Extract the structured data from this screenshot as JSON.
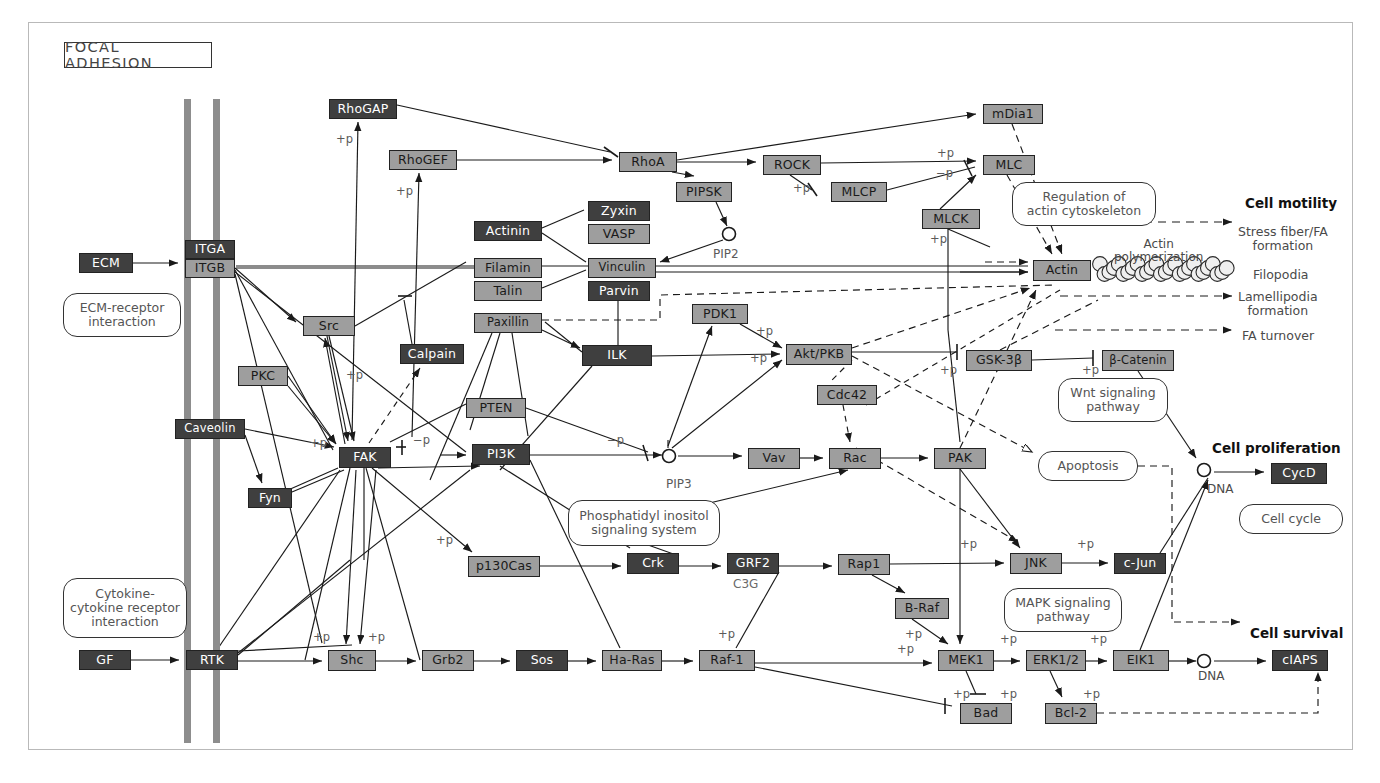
{
  "title": "FOCAL ADHESION",
  "nodes": [
    {
      "id": "rhogap",
      "label": "RhoGAP",
      "x": 329,
      "y": 99,
      "w": 68,
      "h": 20,
      "style": "dark"
    },
    {
      "id": "rhogef",
      "label": "RhoGEF",
      "x": 389,
      "y": 150,
      "w": 68,
      "h": 20,
      "style": "light"
    },
    {
      "id": "mdia1",
      "label": "mDia1",
      "x": 983,
      "y": 104,
      "w": 60,
      "h": 20,
      "style": "light"
    },
    {
      "id": "rhoa",
      "label": "RhoA",
      "x": 619,
      "y": 152,
      "w": 58,
      "h": 20,
      "style": "light"
    },
    {
      "id": "rock",
      "label": "ROCK",
      "x": 763,
      "y": 155,
      "w": 58,
      "h": 20,
      "style": "light"
    },
    {
      "id": "mlc",
      "label": "MLC",
      "x": 983,
      "y": 155,
      "w": 52,
      "h": 20,
      "style": "light"
    },
    {
      "id": "pipsk",
      "label": "PIPSK",
      "x": 676,
      "y": 182,
      "w": 56,
      "h": 20,
      "style": "light"
    },
    {
      "id": "mlcp",
      "label": "MLCP",
      "x": 831,
      "y": 182,
      "w": 56,
      "h": 20,
      "style": "light"
    },
    {
      "id": "mlck",
      "label": "MLCK",
      "x": 922,
      "y": 209,
      "w": 58,
      "h": 20,
      "style": "light"
    },
    {
      "id": "zyxin",
      "label": "Zyxin",
      "x": 588,
      "y": 201,
      "w": 62,
      "h": 20,
      "style": "dark"
    },
    {
      "id": "actinin",
      "label": "Actinin",
      "x": 474,
      "y": 221,
      "w": 68,
      "h": 20,
      "style": "dark"
    },
    {
      "id": "vasp",
      "label": "VASP",
      "x": 588,
      "y": 224,
      "w": 62,
      "h": 20,
      "style": "light"
    },
    {
      "id": "ecm",
      "label": "ECM",
      "x": 79,
      "y": 253,
      "w": 54,
      "h": 20,
      "style": "dark"
    },
    {
      "id": "itga",
      "label": "ITGA",
      "x": 185,
      "y": 240,
      "w": 50,
      "h": 19,
      "style": "dark"
    },
    {
      "id": "itgb",
      "label": "ITGB",
      "x": 185,
      "y": 259,
      "w": 50,
      "h": 19,
      "style": "light"
    },
    {
      "id": "filamin",
      "label": "Filamin",
      "x": 474,
      "y": 258,
      "w": 68,
      "h": 20,
      "style": "light"
    },
    {
      "id": "vinculin",
      "label": "Vinculin",
      "x": 588,
      "y": 258,
      "w": 68,
      "h": 20,
      "style": "light"
    },
    {
      "id": "talin",
      "label": "Talin",
      "x": 474,
      "y": 281,
      "w": 68,
      "h": 20,
      "style": "light"
    },
    {
      "id": "parvin",
      "label": "Parvin",
      "x": 588,
      "y": 281,
      "w": 62,
      "h": 20,
      "style": "dark"
    },
    {
      "id": "actin",
      "label": "Actin",
      "x": 1033,
      "y": 260,
      "w": 58,
      "h": 21,
      "style": "light"
    },
    {
      "id": "paxillin",
      "label": "Paxillin",
      "x": 474,
      "y": 313,
      "w": 68,
      "h": 20,
      "style": "light"
    },
    {
      "id": "pdk1",
      "label": "PDK1",
      "x": 692,
      "y": 304,
      "w": 56,
      "h": 20,
      "style": "light"
    },
    {
      "id": "src",
      "label": "Src",
      "x": 303,
      "y": 316,
      "w": 52,
      "h": 20,
      "style": "light"
    },
    {
      "id": "calpain",
      "label": "Calpain",
      "x": 400,
      "y": 344,
      "w": 64,
      "h": 20,
      "style": "dark"
    },
    {
      "id": "ilk",
      "label": "ILK",
      "x": 582,
      "y": 345,
      "w": 70,
      "h": 21,
      "style": "dark"
    },
    {
      "id": "aktpkb",
      "label": "Akt/PKB",
      "x": 786,
      "y": 344,
      "w": 66,
      "h": 21,
      "style": "light"
    },
    {
      "id": "gsk3b",
      "label": "GSK-3β",
      "x": 966,
      "y": 350,
      "w": 66,
      "h": 21,
      "style": "light"
    },
    {
      "id": "bcatenin",
      "label": "β-Catenin",
      "x": 1102,
      "y": 350,
      "w": 72,
      "h": 21,
      "style": "light"
    },
    {
      "id": "pkc",
      "label": "PKC",
      "x": 238,
      "y": 366,
      "w": 50,
      "h": 20,
      "style": "light"
    },
    {
      "id": "cdc42",
      "label": "Cdc42",
      "x": 817,
      "y": 385,
      "w": 60,
      "h": 20,
      "style": "light"
    },
    {
      "id": "pten",
      "label": "PTEN",
      "x": 466,
      "y": 398,
      "w": 60,
      "h": 20,
      "style": "light"
    },
    {
      "id": "caveolin",
      "label": "Caveolin",
      "x": 175,
      "y": 419,
      "w": 70,
      "h": 20,
      "style": "dark"
    },
    {
      "id": "fak",
      "label": "FAK",
      "x": 339,
      "y": 447,
      "w": 52,
      "h": 21,
      "style": "dark"
    },
    {
      "id": "pi3k",
      "label": "PI3K",
      "x": 472,
      "y": 444,
      "w": 58,
      "h": 21,
      "style": "dark"
    },
    {
      "id": "vav",
      "label": "Vav",
      "x": 748,
      "y": 448,
      "w": 52,
      "h": 21,
      "style": "light"
    },
    {
      "id": "rac",
      "label": "Rac",
      "x": 829,
      "y": 448,
      "w": 52,
      "h": 21,
      "style": "light"
    },
    {
      "id": "pak",
      "label": "PAK",
      "x": 934,
      "y": 448,
      "w": 52,
      "h": 21,
      "style": "light"
    },
    {
      "id": "cycd",
      "label": "CycD",
      "x": 1271,
      "y": 463,
      "w": 56,
      "h": 21,
      "style": "dark"
    },
    {
      "id": "fyn",
      "label": "Fyn",
      "x": 248,
      "y": 488,
      "w": 44,
      "h": 20,
      "style": "dark"
    },
    {
      "id": "dock1",
      "label": "DOCK1",
      "x": 596,
      "y": 513,
      "w": 64,
      "h": 20,
      "style": "light"
    },
    {
      "id": "p130cas",
      "label": "p130Cas",
      "x": 468,
      "y": 556,
      "w": 72,
      "h": 21,
      "style": "light"
    },
    {
      "id": "crk",
      "label": "Crk",
      "x": 627,
      "y": 553,
      "w": 52,
      "h": 21,
      "style": "dark"
    },
    {
      "id": "grf2",
      "label": "GRF2",
      "x": 727,
      "y": 553,
      "w": 52,
      "h": 21,
      "style": "dark"
    },
    {
      "id": "rap1",
      "label": "Rap1",
      "x": 838,
      "y": 554,
      "w": 52,
      "h": 21,
      "style": "light"
    },
    {
      "id": "jnk",
      "label": "JNK",
      "x": 1010,
      "y": 553,
      "w": 52,
      "h": 21,
      "style": "light"
    },
    {
      "id": "cjun",
      "label": "c-Jun",
      "x": 1114,
      "y": 553,
      "w": 52,
      "h": 21,
      "style": "dark"
    },
    {
      "id": "braf",
      "label": "B-Raf",
      "x": 895,
      "y": 598,
      "w": 54,
      "h": 21,
      "style": "light"
    },
    {
      "id": "gf",
      "label": "GF",
      "x": 79,
      "y": 650,
      "w": 52,
      "h": 20,
      "style": "dark"
    },
    {
      "id": "rtk",
      "label": "RTK",
      "x": 186,
      "y": 650,
      "w": 52,
      "h": 20,
      "style": "dark"
    },
    {
      "id": "shc",
      "label": "Shc",
      "x": 328,
      "y": 650,
      "w": 48,
      "h": 21,
      "style": "light"
    },
    {
      "id": "grb2",
      "label": "Grb2",
      "x": 422,
      "y": 650,
      "w": 52,
      "h": 21,
      "style": "light"
    },
    {
      "id": "sos",
      "label": "Sos",
      "x": 516,
      "y": 650,
      "w": 52,
      "h": 21,
      "style": "dark"
    },
    {
      "id": "haras",
      "label": "Ha-Ras",
      "x": 602,
      "y": 650,
      "w": 60,
      "h": 21,
      "style": "light"
    },
    {
      "id": "raf1",
      "label": "Raf-1",
      "x": 699,
      "y": 650,
      "w": 56,
      "h": 21,
      "style": "light"
    },
    {
      "id": "mek1",
      "label": "MEK1",
      "x": 938,
      "y": 650,
      "w": 56,
      "h": 21,
      "style": "light"
    },
    {
      "id": "erk12",
      "label": "ERK1/2",
      "x": 1026,
      "y": 650,
      "w": 60,
      "h": 21,
      "style": "light"
    },
    {
      "id": "elk1",
      "label": "EIK1",
      "x": 1113,
      "y": 650,
      "w": 56,
      "h": 21,
      "style": "light"
    },
    {
      "id": "ciaps",
      "label": "cIAPS",
      "x": 1272,
      "y": 650,
      "w": 56,
      "h": 21,
      "style": "dark"
    },
    {
      "id": "bad",
      "label": "Bad",
      "x": 960,
      "y": 703,
      "w": 52,
      "h": 21,
      "style": "light"
    },
    {
      "id": "bcl2",
      "label": "Bcl-2",
      "x": 1045,
      "y": 703,
      "w": 52,
      "h": 21,
      "style": "light"
    }
  ],
  "pathway_boxes": [
    {
      "id": "ecm-receptor",
      "lines": [
        "ECM-receptor",
        "interaction"
      ],
      "x": 63,
      "y": 293,
      "w": 118,
      "h": 44
    },
    {
      "id": "reg-actin",
      "lines": [
        "Regulation of",
        "actin cytoskeleton"
      ],
      "x": 1012,
      "y": 182,
      "w": 144,
      "h": 44
    },
    {
      "id": "wnt",
      "lines": [
        "Wnt signaling",
        "pathway"
      ],
      "x": 1058,
      "y": 378,
      "w": 110,
      "h": 44
    },
    {
      "id": "apoptosis",
      "lines": [
        "Apoptosis"
      ],
      "x": 1038,
      "y": 451,
      "w": 100,
      "h": 30
    },
    {
      "id": "cell-cycle",
      "lines": [
        "Cell cycle"
      ],
      "x": 1239,
      "y": 504,
      "w": 104,
      "h": 30
    },
    {
      "id": "pi-signaling",
      "lines": [
        "Phosphatidyl inositol",
        "signaling system"
      ],
      "x": 568,
      "y": 500,
      "w": 152,
      "h": 46
    },
    {
      "id": "mapk",
      "lines": [
        "MAPK signaling",
        "pathway"
      ],
      "x": 1004,
      "y": 588,
      "w": 118,
      "h": 44
    },
    {
      "id": "cytokine",
      "lines": [
        "Cytokine-",
        "cytokine receptor",
        "interaction"
      ],
      "x": 63,
      "y": 578,
      "w": 124,
      "h": 60
    }
  ],
  "plain_labels": [
    {
      "id": "pip2",
      "text": "PIP2",
      "x": 713,
      "y": 248,
      "color": "#5a5a5a",
      "size": 12
    },
    {
      "id": "pip3",
      "text": "PIP3",
      "x": 666,
      "y": 478,
      "color": "#5a5a5a",
      "size": 12
    },
    {
      "id": "dna-prolif",
      "text": "DNA",
      "x": 1207,
      "y": 483,
      "color": "#4a4a4a",
      "size": 12
    },
    {
      "id": "dna-survival",
      "text": "DNA",
      "x": 1198,
      "y": 670,
      "color": "#4a4a4a",
      "size": 12
    },
    {
      "id": "c3g",
      "text": "C3G",
      "x": 733,
      "y": 578,
      "color": "#6a6a6a",
      "size": 12
    },
    {
      "id": "actin-polymerization",
      "text": "Actin\npolymerization",
      "x": 1114,
      "y": 238,
      "color": "#4a4a4a",
      "size": 12
    },
    {
      "id": "cell-motility",
      "text": "Cell motility",
      "x": 1245,
      "y": 196,
      "bold": true,
      "size": 13.5
    },
    {
      "id": "stress-fiber",
      "text": "Stress fiber/FA\nformation",
      "x": 1238,
      "y": 225,
      "color": "#4a4a4a",
      "size": 12.5
    },
    {
      "id": "filopodia",
      "text": "Filopodia",
      "x": 1253,
      "y": 268,
      "color": "#4a4a4a",
      "size": 12.5
    },
    {
      "id": "lamellipodia",
      "text": "Lamellipodia\nformation",
      "x": 1238,
      "y": 290,
      "color": "#4a4a4a",
      "size": 12.5
    },
    {
      "id": "fa-turnover",
      "text": "FA turnover",
      "x": 1242,
      "y": 329,
      "color": "#4a4a4a",
      "size": 12.5
    },
    {
      "id": "cell-proliferation",
      "text": "Cell proliferation",
      "x": 1212,
      "y": 441,
      "bold": true,
      "size": 13.5
    },
    {
      "id": "cell-survival",
      "text": "Cell survival",
      "x": 1250,
      "y": 626,
      "bold": true,
      "size": 13.5
    }
  ],
  "phospho_labels": [
    {
      "id": "p-rhogap",
      "text": "+p",
      "x": 336,
      "y": 133
    },
    {
      "id": "p-rhogef",
      "text": "+p",
      "x": 396,
      "y": 185
    },
    {
      "id": "p-rock-mlcp",
      "text": "+p",
      "x": 793,
      "y": 182
    },
    {
      "id": "p-mlc",
      "text": "+p",
      "x": 937,
      "y": 147
    },
    {
      "id": "m-mlcp-mlc",
      "text": "−p",
      "x": 936,
      "y": 167
    },
    {
      "id": "p-mlck",
      "text": "+p",
      "x": 930,
      "y": 233
    },
    {
      "id": "p-pdk1-akt",
      "text": "+p",
      "x": 756,
      "y": 325
    },
    {
      "id": "p-ilk-akt",
      "text": "+p",
      "x": 750,
      "y": 352
    },
    {
      "id": "p-akt-gsk",
      "text": "+p",
      "x": 940,
      "y": 364
    },
    {
      "id": "p-gsk-bcat",
      "text": "+p",
      "x": 1082,
      "y": 364
    },
    {
      "id": "p-src",
      "text": "+p",
      "x": 346,
      "y": 369
    },
    {
      "id": "p-fak-left",
      "text": "+p",
      "x": 310,
      "y": 437
    },
    {
      "id": "m-fak-pi3k",
      "text": "−p",
      "x": 413,
      "y": 434
    },
    {
      "id": "m-pten-pip3",
      "text": "−p",
      "x": 607,
      "y": 434
    },
    {
      "id": "p-p130cas",
      "text": "+p",
      "x": 436,
      "y": 534
    },
    {
      "id": "p-jnk",
      "text": "+p",
      "x": 960,
      "y": 538
    },
    {
      "id": "p-jnk-cjun",
      "text": "+p",
      "x": 1077,
      "y": 538
    },
    {
      "id": "p-raf1-mek",
      "text": "+p",
      "x": 718,
      "y": 628
    },
    {
      "id": "p-braf-mek",
      "text": "+p",
      "x": 905,
      "y": 628
    },
    {
      "id": "p-mek-left",
      "text": "+p",
      "x": 897,
      "y": 643
    },
    {
      "id": "p-mek-erk",
      "text": "+p",
      "x": 1000,
      "y": 633
    },
    {
      "id": "p-erk-elk",
      "text": "+p",
      "x": 1090,
      "y": 633
    },
    {
      "id": "p-mek-bad",
      "text": "+p",
      "x": 1000,
      "y": 688
    },
    {
      "id": "p-erk-bcl2",
      "text": "+p",
      "x": 1083,
      "y": 688
    },
    {
      "id": "p-bad-left",
      "text": "+p",
      "x": 953,
      "y": 688
    },
    {
      "id": "p-shc-left",
      "text": "+p",
      "x": 313,
      "y": 631
    },
    {
      "id": "p-shc-right",
      "text": "+p",
      "x": 368,
      "y": 631
    }
  ],
  "membranes": [
    {
      "id": "membrane-outer",
      "x": 184,
      "y": 99,
      "h": 644
    },
    {
      "id": "membrane-inner",
      "x": 213,
      "y": 99,
      "h": 644
    }
  ],
  "colors": {
    "dark_node": "#3f3f3f",
    "light_node": "#9e9e9e",
    "membrane": "#8d8d8d",
    "stroke": "#1a1a1a",
    "frame": "#b9b9b9"
  }
}
